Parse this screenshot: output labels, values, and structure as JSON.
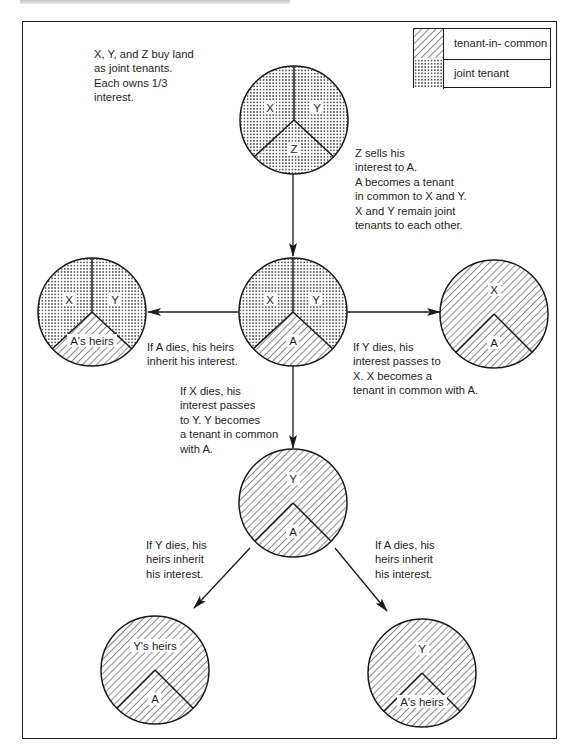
{
  "legend": {
    "items": [
      {
        "pattern": "hatch",
        "label": "tenant-in- common"
      },
      {
        "pattern": "dots",
        "label": "joint tenant"
      }
    ]
  },
  "captions": {
    "initial": "X, Y, and Z buy land\nas joint tenants.\nEach owns 1/3\ninterest.",
    "z_sells": "Z sells his\ninterest to A.\nA becomes a tenant\nin common to X and Y.\nX and Y remain joint\ntenants to each other.",
    "a_dies": "If A dies, his heirs\ninherit his interest.",
    "y_dies_first": "If Y dies, his\ninterest passes to\nX. X becomes a\ntenant in common with A.",
    "x_dies": "If X dies, his\ninterest passes\nto Y. Y becomes\na tenant in common\nwith A.",
    "y_dies_second": "If Y dies, his\nheirs inherit\nhis interest.",
    "a_dies_second": "If A dies, his\nheirs inherit\nhis interest."
  },
  "circles": {
    "start": {
      "labels": [
        "X",
        "Y",
        "Z"
      ],
      "tenancy": "joint tenants (all three)"
    },
    "after_sale": {
      "labels": [
        "X",
        "Y",
        "A"
      ],
      "tenancy": "X,Y joint; A in common"
    },
    "a_dies": {
      "labels": [
        "X",
        "Y",
        "A's heirs"
      ]
    },
    "y_dies_first": {
      "labels": [
        "X",
        "A"
      ]
    },
    "x_dies": {
      "labels": [
        "Y",
        "A"
      ]
    },
    "y_dies_second": {
      "labels": [
        "Y's heirs",
        "A"
      ]
    },
    "a_dies_second": {
      "labels": [
        "Y",
        "A's heirs"
      ]
    }
  },
  "colors": {
    "ink": "#1a1a1a",
    "paper": "#ffffff"
  }
}
